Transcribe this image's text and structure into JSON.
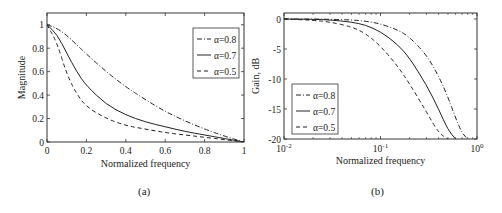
{
  "chart_data": [
    {
      "id": "a",
      "type": "line",
      "caption": "(a)",
      "xlabel": "Normalized frequency",
      "ylabel": "Magnitude",
      "xlim": [
        0,
        1
      ],
      "ylim": [
        0,
        1.1
      ],
      "xticks": [
        "0",
        "0.2",
        "0.4",
        "0.6",
        "0.8",
        "1"
      ],
      "yticks": [
        "0",
        "0.2",
        "0.4",
        "0.6",
        "0.8",
        "1"
      ],
      "legend_position": "upper right",
      "x": [
        0,
        0.05,
        0.1,
        0.15,
        0.2,
        0.3,
        0.4,
        0.5,
        0.6,
        0.7,
        0.8,
        0.9,
        1.0
      ],
      "series": [
        {
          "name": "α=0.8",
          "style": "dash-dot",
          "values": [
            1.0,
            0.97,
            0.91,
            0.83,
            0.75,
            0.6,
            0.47,
            0.36,
            0.26,
            0.18,
            0.11,
            0.05,
            0.0
          ]
        },
        {
          "name": "α=0.7",
          "style": "solid",
          "values": [
            1.0,
            0.92,
            0.76,
            0.6,
            0.48,
            0.32,
            0.23,
            0.17,
            0.13,
            0.09,
            0.06,
            0.03,
            0.0
          ]
        },
        {
          "name": "α=0.5",
          "style": "dashed",
          "values": [
            1.0,
            0.85,
            0.58,
            0.41,
            0.3,
            0.2,
            0.14,
            0.11,
            0.08,
            0.06,
            0.04,
            0.02,
            0.0
          ]
        }
      ]
    },
    {
      "id": "b",
      "type": "line",
      "caption": "(b)",
      "xlabel": "Normalized frequency",
      "ylabel": "Gain, dB",
      "xscale": "log",
      "xlim": [
        0.01,
        1
      ],
      "ylim": [
        -20,
        1
      ],
      "xticks": [
        "10-2",
        "10-1",
        "100"
      ],
      "yticks": [
        "0",
        "-5",
        "-10",
        "-15",
        "-20"
      ],
      "legend_position": "lower left",
      "x": [
        0.01,
        0.02,
        0.03,
        0.05,
        0.07,
        0.1,
        0.15,
        0.2,
        0.3,
        0.4,
        0.5,
        0.6,
        0.7,
        0.8
      ],
      "series": [
        {
          "name": "α=0.8",
          "style": "dash-dot",
          "values": [
            0,
            0,
            -0.05,
            -0.15,
            -0.35,
            -0.8,
            -1.8,
            -3.0,
            -6.0,
            -9.5,
            -13.0,
            -16.5,
            -19.0,
            -20.0
          ]
        },
        {
          "name": "α=0.7",
          "style": "solid",
          "values": [
            0,
            -0.05,
            -0.15,
            -0.5,
            -1.0,
            -2.1,
            -4.2,
            -6.5,
            -11.0,
            -15.0,
            -18.5,
            -20.0,
            null,
            null
          ]
        },
        {
          "name": "α=0.5",
          "style": "dashed",
          "values": [
            0,
            -0.2,
            -0.5,
            -1.3,
            -2.4,
            -4.5,
            -7.8,
            -10.8,
            -15.5,
            -19.0,
            -20.0,
            null,
            null,
            null
          ]
        }
      ]
    }
  ]
}
